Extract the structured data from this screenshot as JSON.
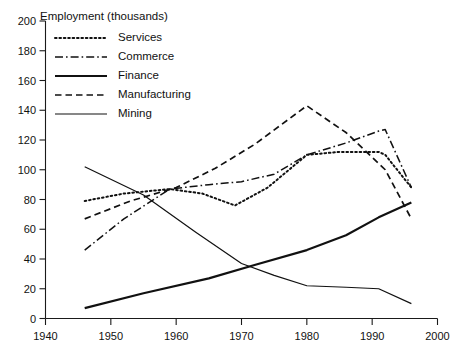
{
  "chart_data": {
    "type": "line",
    "title": "",
    "ylabel": "Employment (thousands)",
    "xlabel": "",
    "xlim": [
      1940,
      2000
    ],
    "ylim": [
      0,
      200
    ],
    "xticks": [
      1940,
      1950,
      1960,
      1970,
      1980,
      1990,
      2000
    ],
    "yticks": [
      0,
      20,
      40,
      60,
      80,
      100,
      120,
      140,
      160,
      180,
      200
    ],
    "grid": false,
    "legend_position": "upper-left-inside",
    "series": [
      {
        "name": "Services",
        "style": "dotted",
        "x": [
          1946,
          1952,
          1959,
          1964,
          1969,
          1974,
          1980,
          1985,
          1991,
          1992,
          1996
        ],
        "values": [
          79,
          84,
          87,
          84,
          76,
          88,
          110,
          112,
          112,
          110,
          88
        ]
      },
      {
        "name": "Commerce",
        "style": "dash-dot",
        "x": [
          1946,
          1952,
          1959,
          1965,
          1970,
          1975,
          1980,
          1986,
          1991,
          1992,
          1996
        ],
        "values": [
          46,
          67,
          87,
          90,
          92,
          97,
          110,
          118,
          126,
          127,
          88
        ]
      },
      {
        "name": "Finance",
        "style": "solid-thick",
        "x": [
          1946,
          1955,
          1965,
          1972,
          1980,
          1986,
          1991,
          1996
        ],
        "values": [
          7,
          17,
          27,
          36,
          46,
          56,
          68,
          78
        ]
      },
      {
        "name": "Manufacturing",
        "style": "dashed",
        "x": [
          1946,
          1953,
          1960,
          1966,
          1972,
          1980,
          1986,
          1992,
          1996
        ],
        "values": [
          67,
          79,
          88,
          101,
          117,
          143,
          125,
          100,
          67
        ]
      },
      {
        "name": "Mining",
        "style": "solid-thin",
        "x": [
          1946,
          1955,
          1963,
          1970,
          1975,
          1980,
          1986,
          1991,
          1996
        ],
        "values": [
          102,
          83,
          58,
          37,
          29,
          22,
          21,
          20,
          10
        ]
      }
    ]
  },
  "legend": {
    "entries": [
      {
        "label": "Services"
      },
      {
        "label": "Commerce"
      },
      {
        "label": "Finance"
      },
      {
        "label": "Manufacturing"
      },
      {
        "label": "Mining"
      }
    ]
  }
}
